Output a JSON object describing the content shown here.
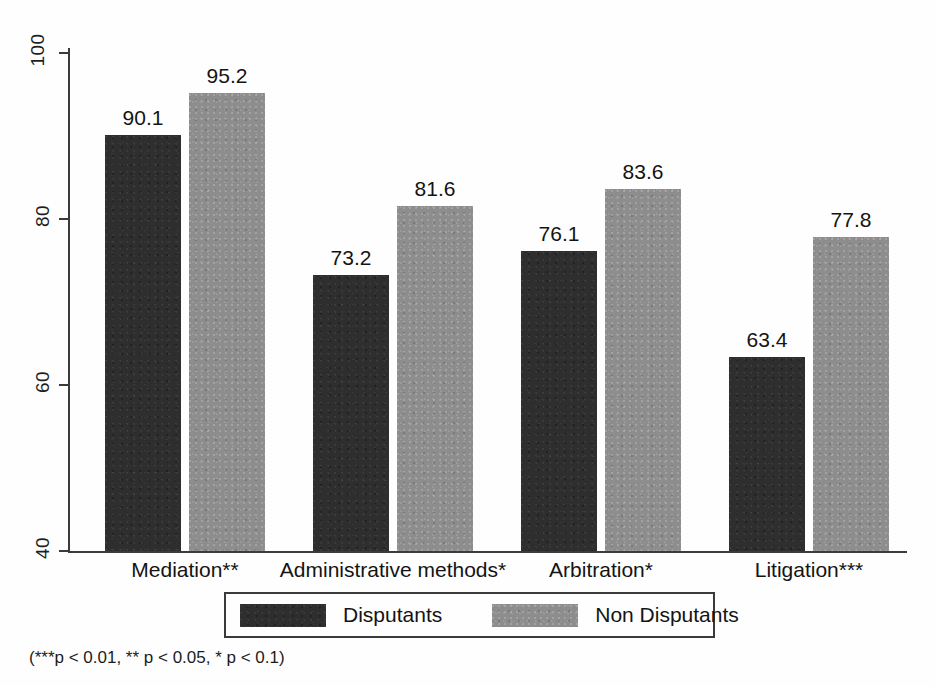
{
  "chart_data": {
    "type": "bar",
    "title": "",
    "subtitle": "",
    "xlabel": "",
    "ylabel": "",
    "ylim": [
      40,
      100
    ],
    "yticks": [
      40,
      60,
      80,
      100
    ],
    "ytick_labels": [
      "40",
      "60",
      "80",
      "100"
    ],
    "grid": false,
    "legend_position": "bottom",
    "orientation": "vertical",
    "grouped": true,
    "categories": [
      "Mediation**",
      "Administrative methods*",
      "Arbitration*",
      "Litigation***"
    ],
    "series": [
      {
        "name": "Disputants",
        "color": "#2e2e2e",
        "values": [
          90.1,
          73.2,
          76.1,
          63.4
        ],
        "value_labels": [
          "90.1",
          "73.2",
          "76.1",
          "63.4"
        ]
      },
      {
        "name": "Non Disputants",
        "color": "#8d8d8d",
        "values": [
          95.2,
          81.6,
          83.6,
          77.8
        ],
        "value_labels": [
          "95.2",
          "81.6",
          "83.6",
          "77.8"
        ]
      }
    ],
    "annotations": [
      "(***p < 0.01, ** p < 0.05, * p < 0.1)"
    ]
  },
  "legend": {
    "entries": [
      {
        "label": "Disputants",
        "color": "#2e2e2e"
      },
      {
        "label": "Non Disputants",
        "color": "#8d8d8d"
      }
    ]
  },
  "footnote": {
    "text": "(***p < 0.01, ** p < 0.05, * p < 0.1)"
  },
  "axis": {
    "y_tick_labels": [
      "100",
      "80",
      "60",
      "40"
    ]
  }
}
